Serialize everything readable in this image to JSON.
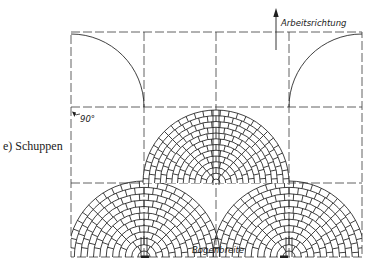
{
  "caption": "e) Schuppen",
  "labels": {
    "direction": "Arbeitsrichtung",
    "width": "Bogenbreite",
    "angle": "90°"
  },
  "colors": {
    "line": "#1f1f1f",
    "grid": "#3a3a3a",
    "background": "#ffffff"
  },
  "geometry": {
    "frame": {
      "x1": 71,
      "y1": 32,
      "x2": 362,
      "y2": 257
    },
    "grid_v": [
      144,
      216,
      289
    ],
    "grid_h": [
      107,
      183
    ],
    "radius": 73,
    "upper_quarter_arcs": [
      {
        "cx": 71,
        "cy": 107,
        "side": "left"
      },
      {
        "cx": 362,
        "cy": 107,
        "side": "right"
      }
    ],
    "brick_fan": {
      "cx": 216,
      "cy": 183,
      "rings": 12,
      "rows_visible": "full"
    },
    "ring_fans": [
      {
        "cx": 144,
        "cy": 257
      },
      {
        "cx": 289,
        "cy": 257
      }
    ],
    "ring_count": 11
  }
}
